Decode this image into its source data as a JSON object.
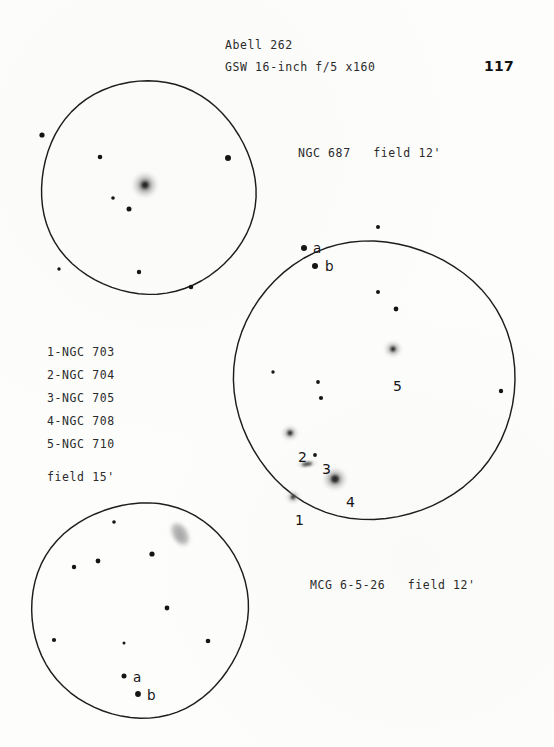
{
  "page": {
    "number": "117",
    "background_color": "#fdfdfc",
    "ink_color": "#1a1a1a"
  },
  "header": {
    "object_title": "Abell 262",
    "instrument": "GSW 16-inch f/5 x160"
  },
  "captions": {
    "top_panel": "NGC 687   field 12'",
    "bottom_panel": "MCG 6-5-26   field 12'",
    "cluster_field": "field 15'"
  },
  "legend": {
    "items": [
      "1-NGC 703",
      "2-NGC 704",
      "3-NGC 705",
      "4-NGC 708",
      "5-NGC 710"
    ]
  },
  "panels": [
    {
      "id": "ngc687",
      "name": "ngc-687-eyepiece-circle",
      "caption": "NGC 687   field 12'",
      "circle": {
        "cx": 148,
        "cy": 188,
        "r": 107
      },
      "galaxies": [
        {
          "label": "",
          "x": 145,
          "y": 185,
          "rx": 9,
          "ry": 9,
          "core": 3.0,
          "brightness": "bright",
          "shape": "round"
        }
      ],
      "stars": [
        {
          "x": 42,
          "y": 135,
          "r": 2.6
        },
        {
          "x": 100,
          "y": 157,
          "r": 2.3
        },
        {
          "x": 228,
          "y": 158,
          "r": 3.0
        },
        {
          "x": 113,
          "y": 198,
          "r": 1.8
        },
        {
          "x": 129,
          "y": 209,
          "r": 2.5
        },
        {
          "x": 59,
          "y": 269,
          "r": 1.7
        },
        {
          "x": 139,
          "y": 272,
          "r": 2.2
        },
        {
          "x": 191,
          "y": 287,
          "r": 2.3
        }
      ],
      "point_labels": []
    },
    {
      "id": "abell262",
      "name": "abell-262-cluster-circle",
      "caption": "field 15'",
      "circle": {
        "cx": 374,
        "cy": 380,
        "r": 140
      },
      "galaxies": [
        {
          "label": "1",
          "x": 293,
          "y": 497,
          "rx": 5.5,
          "ry": 5.0,
          "core": 2.0,
          "brightness": "faint",
          "shape": "round",
          "label_x": 295,
          "label_y": 512
        },
        {
          "label": "2",
          "x": 290,
          "y": 433,
          "rx": 6.0,
          "ry": 5.5,
          "core": 2.2,
          "brightness": "medium",
          "shape": "round",
          "label_x": 298,
          "label_y": 449
        },
        {
          "label": "3",
          "x": 307,
          "y": 464,
          "rx": 8.0,
          "ry": 3.0,
          "core": 1.8,
          "brightness": "faint",
          "shape": "edge-on",
          "label_x": 322,
          "label_y": 461
        },
        {
          "label": "4",
          "x": 335,
          "y": 479,
          "rx": 8.5,
          "ry": 8.0,
          "core": 3.2,
          "brightness": "bright",
          "shape": "round",
          "label_x": 346,
          "label_y": 494
        },
        {
          "label": "5",
          "x": 393,
          "y": 349,
          "rx": 6.5,
          "ry": 6.0,
          "core": 2.2,
          "brightness": "medium",
          "shape": "round",
          "label_x": 393,
          "label_y": 378
        }
      ],
      "stars": [
        {
          "x": 378,
          "y": 227,
          "r": 2.0
        },
        {
          "x": 304,
          "y": 248,
          "r": 3.0
        },
        {
          "x": 315,
          "y": 266,
          "r": 3.0
        },
        {
          "x": 378,
          "y": 292,
          "r": 2.0
        },
        {
          "x": 396,
          "y": 309,
          "r": 2.4
        },
        {
          "x": 273,
          "y": 372,
          "r": 1.7
        },
        {
          "x": 318,
          "y": 382,
          "r": 1.9
        },
        {
          "x": 321,
          "y": 398,
          "r": 2.1
        },
        {
          "x": 501,
          "y": 391,
          "r": 2.2
        },
        {
          "x": 315,
          "y": 455,
          "r": 1.9
        }
      ],
      "point_labels": [
        {
          "text": "a",
          "x": 313,
          "y": 240
        },
        {
          "text": "b",
          "x": 325,
          "y": 258
        }
      ]
    },
    {
      "id": "mcg6526",
      "name": "mcg-6-5-26-eyepiece-circle",
      "caption": "MCG 6-5-26   field 12'",
      "circle": {
        "cx": 140,
        "cy": 610,
        "r": 108
      },
      "galaxies": [
        {
          "label": "",
          "x": 180,
          "y": 534,
          "rx": 9,
          "ry": 13,
          "core": 0,
          "brightness": "faint",
          "shape": "irregular"
        }
      ],
      "stars": [
        {
          "x": 114,
          "y": 522,
          "r": 1.8
        },
        {
          "x": 152,
          "y": 554,
          "r": 2.6
        },
        {
          "x": 98,
          "y": 561,
          "r": 2.4
        },
        {
          "x": 74,
          "y": 567,
          "r": 2.2
        },
        {
          "x": 167,
          "y": 608,
          "r": 2.4
        },
        {
          "x": 54,
          "y": 640,
          "r": 2.1
        },
        {
          "x": 124,
          "y": 643,
          "r": 1.5
        },
        {
          "x": 208,
          "y": 641,
          "r": 2.3
        },
        {
          "x": 124,
          "y": 676,
          "r": 2.5
        },
        {
          "x": 138,
          "y": 694,
          "r": 2.9
        }
      ],
      "point_labels": [
        {
          "text": "a",
          "x": 133,
          "y": 669
        },
        {
          "text": "b",
          "x": 147,
          "y": 687
        }
      ]
    }
  ]
}
